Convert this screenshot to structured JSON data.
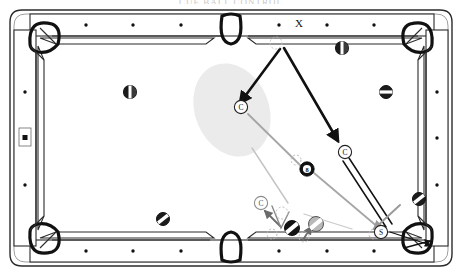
{
  "figure": {
    "kind": "pool-table-diagram",
    "clipped_caption": "CUE BALL CONTROL",
    "table": {
      "cloth_color": "#ffffff",
      "rail_color": "#ffffff",
      "outline_color": "#1a1a1a",
      "frame_color": "#2b2b2b",
      "diamond_color": "#111111",
      "diamond_count_long_rail": 7,
      "diamond_count_short_rail": 3
    },
    "shaded_zone": {
      "label": "cue-ball-landing-zone",
      "color": "#e9e9e9",
      "cx": 232,
      "cy": 110,
      "rx": 36,
      "ry": 48,
      "rotation": -22
    },
    "markers": [
      {
        "id": "rail-label-x",
        "text": "X",
        "x": 299,
        "y": 23,
        "note": "target rail spot marker"
      },
      {
        "id": "cue-ball-landing",
        "text": "C",
        "x": 241,
        "y": 107,
        "note": "cue ball resting position in zone"
      },
      {
        "id": "cue-ball-contact",
        "text": "C",
        "x": 345,
        "y": 152,
        "note": "cue ball at object-ball contact"
      },
      {
        "id": "cue-ball-start",
        "text": "C",
        "x": 261,
        "y": 203,
        "note": "cue ball start position"
      },
      {
        "id": "stun-point",
        "text": "S",
        "x": 381,
        "y": 232,
        "note": "stun / pocket entry marker"
      },
      {
        "id": "eight-ball",
        "text": "8",
        "x": 307,
        "y": 169,
        "note": "eight ball"
      }
    ],
    "balls": [
      {
        "id": "ball-left-upper",
        "x": 130,
        "y": 92,
        "r": 6.5,
        "style": "half-dark"
      },
      {
        "id": "ball-top-right",
        "x": 342,
        "y": 48,
        "r": 6.5,
        "style": "half-dark"
      },
      {
        "id": "ball-right-upper",
        "x": 386,
        "y": 92,
        "r": 6.5,
        "style": "stripe-dark"
      },
      {
        "id": "ball-right-lower",
        "x": 419,
        "y": 199,
        "r": 6.5,
        "style": "stripe-dark"
      },
      {
        "id": "ball-bottom-left",
        "x": 163,
        "y": 219,
        "r": 6.5,
        "style": "stripe-dark"
      },
      {
        "id": "ball-cluster-dark",
        "x": 292,
        "y": 228,
        "r": 7.5,
        "style": "stripe-dark"
      },
      {
        "id": "ball-cluster-gray",
        "x": 316,
        "y": 224,
        "r": 7.5,
        "style": "stripe-gray"
      }
    ],
    "annotations": {
      "ghost_ball_top": {
        "x": 276,
        "y": 43,
        "r": 6,
        "note": "dashed ghost ball at rail contact"
      },
      "ghost_ball_mid": {
        "x": 296,
        "y": 160,
        "r": 5,
        "note": "dashed ghost ball near eight ball"
      },
      "ghost_ball_cluster": {
        "x": 282,
        "y": 213,
        "r": 6,
        "note": "dashed ghost ball in cluster"
      }
    },
    "paths": [
      {
        "id": "path-rail-to-zone",
        "kind": "arrow-thick",
        "color": "#111111",
        "from": [
          279,
          47
        ],
        "to": [
          238,
          104
        ]
      },
      {
        "id": "path-rail-to-contact",
        "kind": "arrow-thick",
        "color": "#111111",
        "from": [
          283,
          46
        ],
        "to": [
          339,
          143
        ]
      },
      {
        "id": "path-zone-to-eight",
        "kind": "line-gray",
        "color": "#999999",
        "from": [
          248,
          114
        ],
        "to": [
          300,
          166
        ]
      },
      {
        "id": "path-eight-to-contact",
        "kind": "line-gray",
        "color": "#999999",
        "from": [
          314,
          172
        ],
        "to": [
          378,
          228
        ]
      },
      {
        "id": "path-cue-to-pocket",
        "kind": "double-line",
        "color": "#111111",
        "from": [
          347,
          160
        ],
        "to": [
          390,
          224
        ]
      },
      {
        "id": "path-stun-arrow",
        "kind": "arrow-gray",
        "color": "#999999",
        "from": [
          396,
          208
        ],
        "to": [
          372,
          231
        ]
      },
      {
        "id": "path-pocket-arrow",
        "kind": "arrow-thin",
        "color": "#111111",
        "from": [
          389,
          232
        ],
        "to": [
          432,
          246
        ]
      },
      {
        "id": "path-cluster-to-cueball",
        "kind": "arrow-thin",
        "color": "#6b6b6b",
        "from": [
          280,
          225
        ],
        "to": [
          264,
          210
        ]
      },
      {
        "id": "path-cluster-inner",
        "kind": "arrow-thin",
        "color": "#6b6b6b",
        "from": [
          304,
          238
        ],
        "to": [
          312,
          226
        ]
      },
      {
        "id": "path-cluster-long",
        "kind": "line-gray",
        "color": "#b5b5b5",
        "from": [
          286,
          200
        ],
        "to": [
          252,
          146
        ]
      }
    ]
  }
}
